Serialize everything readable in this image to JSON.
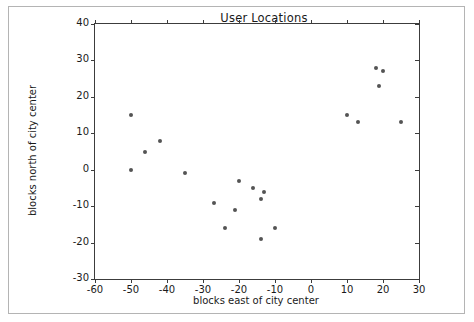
{
  "chart_data": {
    "type": "scatter",
    "title": "User Locations",
    "xlabel": "blocks east of city center",
    "ylabel": "blocks north of city center",
    "xlim": [
      -60,
      30
    ],
    "ylim": [
      -30,
      40
    ],
    "xticks": [
      -60,
      -50,
      -40,
      -30,
      -20,
      -10,
      0,
      10,
      20,
      30
    ],
    "yticks": [
      -30,
      -20,
      -10,
      0,
      10,
      20,
      30,
      40
    ],
    "xtick_labels": [
      "-60",
      "-50",
      "-40",
      "-30",
      "-20",
      "-10",
      "0",
      "10",
      "20",
      "30"
    ],
    "ytick_labels": [
      "-30",
      "-20",
      "-10",
      "0",
      "10",
      "20",
      "30",
      "40"
    ],
    "grid": false,
    "legend": null,
    "marker_color": "#545454",
    "points": [
      {
        "x": -50,
        "y": 15
      },
      {
        "x": -46,
        "y": 5
      },
      {
        "x": -42,
        "y": 8
      },
      {
        "x": -50,
        "y": 0
      },
      {
        "x": -35,
        "y": -1
      },
      {
        "x": -27,
        "y": -9
      },
      {
        "x": -24,
        "y": -16
      },
      {
        "x": -21,
        "y": -11
      },
      {
        "x": -20,
        "y": -3
      },
      {
        "x": -16,
        "y": -5
      },
      {
        "x": -14,
        "y": -8
      },
      {
        "x": -13,
        "y": -6
      },
      {
        "x": -14,
        "y": -19
      },
      {
        "x": -10,
        "y": -16
      },
      {
        "x": 10,
        "y": 15
      },
      {
        "x": 13,
        "y": 13
      },
      {
        "x": 18,
        "y": 28
      },
      {
        "x": 20,
        "y": 27
      },
      {
        "x": 19,
        "y": 23
      },
      {
        "x": 25,
        "y": 13
      }
    ]
  }
}
